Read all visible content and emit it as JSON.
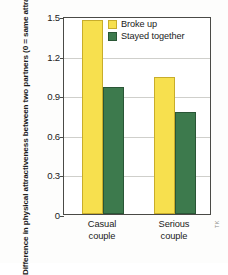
{
  "chart_data": {
    "type": "bar",
    "title": "",
    "xlabel": "",
    "ylabel": "Difference in physical attractiveness between two partners (0 = same attractiveness)",
    "categories": [
      "Casual couple",
      "Serious couple"
    ],
    "category_lines": [
      [
        "Casual",
        "couple"
      ],
      [
        "Serious",
        "couple"
      ]
    ],
    "series": [
      {
        "name": "Broke up",
        "color": "#f7e04e",
        "values": [
          1.47,
          1.04
        ]
      },
      {
        "name": "Stayed together",
        "color": "#3d7a4d",
        "values": [
          0.96,
          0.77
        ]
      }
    ],
    "ylim": [
      0,
      1.5
    ],
    "yticks": [
      0,
      0.3,
      0.6,
      0.9,
      1.2,
      1.5
    ],
    "ytick_labels": [
      "0",
      "0.3",
      "0.6",
      "0.9",
      "1.2",
      "1.5"
    ],
    "grid": true,
    "legend_position": "top-right"
  },
  "legend": {
    "items": [
      {
        "label": "Broke up"
      },
      {
        "label": "Stayed together"
      }
    ]
  },
  "credit": {
    "text": "TK"
  }
}
